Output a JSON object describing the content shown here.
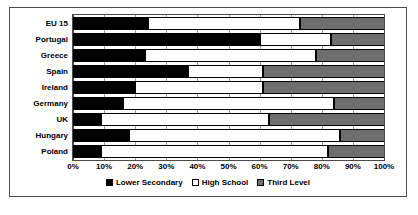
{
  "chart_data": {
    "type": "bar",
    "orientation": "horizontal",
    "stacked": true,
    "stack_mode": "percent",
    "title": "",
    "subtitle": "",
    "xlabel": "",
    "ylabel": "",
    "xlim": [
      0,
      100
    ],
    "grid": true,
    "legend_position": "bottom",
    "categories": [
      "EU 15",
      "Portugal",
      "Greece",
      "Spain",
      "Ireland",
      "Germany",
      "UK",
      "Hungary",
      "Poland"
    ],
    "xticks": [
      "0%",
      "10%",
      "20%",
      "30%",
      "40%",
      "50%",
      "60%",
      "70%",
      "80%",
      "90%",
      "100%"
    ],
    "xtick_values": [
      0,
      10,
      20,
      30,
      40,
      50,
      60,
      70,
      80,
      90,
      100
    ],
    "series": [
      {
        "name": "Lower Secondary",
        "color": "#000000",
        "values": [
          24,
          60,
          23,
          37,
          20,
          16,
          9,
          18,
          9
        ]
      },
      {
        "name": "High School",
        "color": "#ffffff",
        "values": [
          49,
          23,
          55,
          24,
          41,
          68,
          54,
          68,
          73
        ]
      },
      {
        "name": "Third Level",
        "color": "#6e6e6e",
        "values": [
          27,
          17,
          22,
          39,
          39,
          16,
          37,
          14,
          18
        ]
      }
    ]
  },
  "colors": {
    "lower_secondary": "#000000",
    "high_school": "#ffffff",
    "third_level": "#6e6e6e",
    "frame": "#4a4a4a",
    "gridline": "#9a9a9a",
    "background": "#ffffff"
  }
}
